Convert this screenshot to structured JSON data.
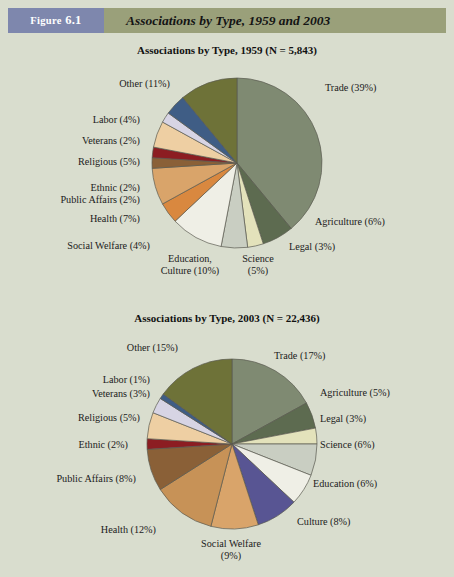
{
  "header": {
    "figure_label": "Figure",
    "figure_number": "6.1",
    "title": "Associations by Type, 1959 and 2003"
  },
  "colors": {
    "page_background": "#d9ddce",
    "header_band": "#9aa07a",
    "figure_tag": "#7e87ad",
    "slice_outline": "#5a5a50",
    "text": "#1b1b1b"
  },
  "chart_data": [
    {
      "type": "pie",
      "title": "Associations by Type, 1959 (N = 5,843)",
      "year": "1959",
      "n": "5,843",
      "start_angle_deg": 0,
      "direction": "clockwise",
      "legend": "labels-around-pie",
      "categories": [
        "Trade",
        "Agriculture",
        "Legal",
        "Science",
        "Education, Culture",
        "Social Welfare",
        "Health",
        "Public Affairs",
        "Ethnic",
        "Religious",
        "Veterans",
        "Labor",
        "Other"
      ],
      "values": [
        39,
        6,
        3,
        5,
        10,
        4,
        7,
        2,
        2,
        5,
        2,
        4,
        11
      ],
      "slices": [
        {
          "label": "Trade (39%)",
          "name": "Trade",
          "value": 39,
          "color": "#7f8a72"
        },
        {
          "label": "Agriculture (6%)",
          "name": "Agriculture",
          "value": 6,
          "color": "#5d6b50"
        },
        {
          "label": "Legal (3%)",
          "name": "Legal",
          "value": 3,
          "color": "#e3e2bb"
        },
        {
          "label": "Science (5%)",
          "name": "Science",
          "value": 5,
          "color": "#c9cec2"
        },
        {
          "label": "Education, Culture (10%)",
          "name": "Education, Culture",
          "value": 10,
          "color": "#efefe6"
        },
        {
          "label": "Social Welfare (4%)",
          "name": "Social Welfare",
          "value": 4,
          "color": "#d9883f"
        },
        {
          "label": "Health (7%)",
          "name": "Health",
          "value": 7,
          "color": "#d9a46a"
        },
        {
          "label": "Public Affairs (2%)",
          "name": "Public Affairs",
          "value": 2,
          "color": "#8a6037"
        },
        {
          "label": "Ethnic (2%)",
          "name": "Ethnic",
          "value": 2,
          "color": "#8c1d22"
        },
        {
          "label": "Religious (5%)",
          "name": "Religious",
          "value": 5,
          "color": "#eecfa3"
        },
        {
          "label": "Veterans (2%)",
          "name": "Veterans",
          "value": 2,
          "color": "#d7d4e4"
        },
        {
          "label": "Labor (4%)",
          "name": "Labor",
          "value": 4,
          "color": "#3f5d85"
        },
        {
          "label": "Other (11%)",
          "name": "Other",
          "value": 11,
          "color": "#6e7238"
        }
      ]
    },
    {
      "type": "pie",
      "title": "Associations by Type, 2003 (N = 22,436)",
      "year": "2003",
      "n": "22,436",
      "start_angle_deg": 0,
      "direction": "clockwise",
      "legend": "labels-around-pie",
      "categories": [
        "Trade",
        "Agriculture",
        "Legal",
        "Science",
        "Education",
        "Culture",
        "Social Welfare",
        "Health",
        "Public Affairs",
        "Ethnic",
        "Religious",
        "Veterans",
        "Labor",
        "Other"
      ],
      "values": [
        17,
        5,
        3,
        6,
        6,
        8,
        9,
        12,
        8,
        2,
        5,
        3,
        1,
        15
      ],
      "slices": [
        {
          "label": "Trade (17%)",
          "name": "Trade",
          "value": 17,
          "color": "#7f8a72"
        },
        {
          "label": "Agriculture (5%)",
          "name": "Agriculture",
          "value": 5,
          "color": "#5d6b50"
        },
        {
          "label": "Legal (3%)",
          "name": "Legal",
          "value": 3,
          "color": "#e3e2bb"
        },
        {
          "label": "Science (6%)",
          "name": "Science",
          "value": 6,
          "color": "#c9cec2"
        },
        {
          "label": "Education (6%)",
          "name": "Education",
          "value": 6,
          "color": "#efefe6"
        },
        {
          "label": "Culture (8%)",
          "name": "Culture",
          "value": 8,
          "color": "#585593"
        },
        {
          "label": "Social Welfare (9%)",
          "name": "Social Welfare",
          "value": 9,
          "color": "#d9a46a"
        },
        {
          "label": "Health (12%)",
          "name": "Health",
          "value": 12,
          "color": "#c79257"
        },
        {
          "label": "Public Affairs (8%)",
          "name": "Public Affairs",
          "value": 8,
          "color": "#8a6037"
        },
        {
          "label": "Ethnic (2%)",
          "name": "Ethnic",
          "value": 2,
          "color": "#8c1d22"
        },
        {
          "label": "Religious (5%)",
          "name": "Religious",
          "value": 5,
          "color": "#eecfa3"
        },
        {
          "label": "Veterans (3%)",
          "name": "Veterans",
          "value": 3,
          "color": "#d7d4e4"
        },
        {
          "label": "Labor (1%)",
          "name": "Labor",
          "value": 1,
          "color": "#3f5d85"
        },
        {
          "label": "Other (15%)",
          "name": "Other",
          "value": 15,
          "color": "#6e7238"
        }
      ]
    }
  ],
  "labels_1": {
    "trade": "Trade (39%)",
    "agriculture": "Agriculture (6%)",
    "legal": "Legal (3%)",
    "science": "Science\n(5%)",
    "science_l1": "Science",
    "science_l2": "(5%)",
    "education_l1": "Education,",
    "education_l2": "Culture (10%)",
    "social_welfare": "Social Welfare (4%)",
    "health": "Health (7%)",
    "public_affairs": "Public Affairs (2%)",
    "ethnic": "Ethnic (2%)",
    "religious": "Religious (5%)",
    "veterans": "Veterans (2%)",
    "labor": "Labor (4%)",
    "other": "Other (11%)"
  },
  "labels_2": {
    "trade": "Trade (17%)",
    "agriculture": "Agriculture (5%)",
    "legal": "Legal (3%)",
    "science": "Science (6%)",
    "education": "Education (6%)",
    "culture": "Culture (8%)",
    "social_welfare_l1": "Social Welfare",
    "social_welfare_l2": "(9%)",
    "health": "Health (12%)",
    "public_affairs": "Public Affairs (8%)",
    "ethnic": "Ethnic (2%)",
    "religious": "Religious (5%)",
    "veterans": "Veterans (3%)",
    "labor": "Labor (1%)",
    "other": "Other (15%)"
  }
}
